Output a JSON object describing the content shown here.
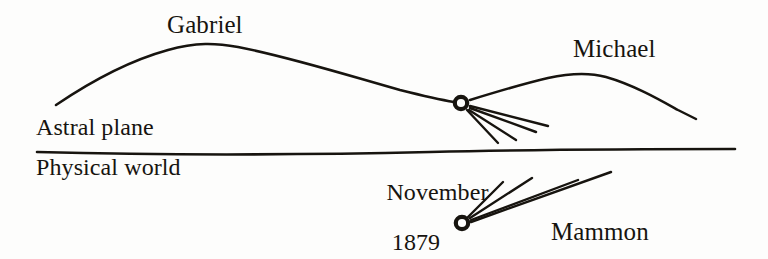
{
  "figure": {
    "type": "diagram",
    "style": "hand-drawn line diagram",
    "background_color": "#fdfdfc",
    "ink_color": "#17140f",
    "width": 768,
    "height": 259
  },
  "labels": {
    "gabriel": "Gabriel",
    "michael": "Michael",
    "astral_plane": "Astral plane",
    "physical_world": "Physical world",
    "date_line1": "November",
    "date_line2": "1879",
    "mammon": "Mammon"
  },
  "elements": {
    "divider_line_name": "astral-physical-boundary",
    "upper_node_name": "astral-node",
    "lower_node_name": "physical-node",
    "gabriel_arc_name": "gabriel-trajectory",
    "michael_arc_name": "michael-trajectory",
    "upper_rays_count": 4,
    "lower_rays_count": 4
  }
}
